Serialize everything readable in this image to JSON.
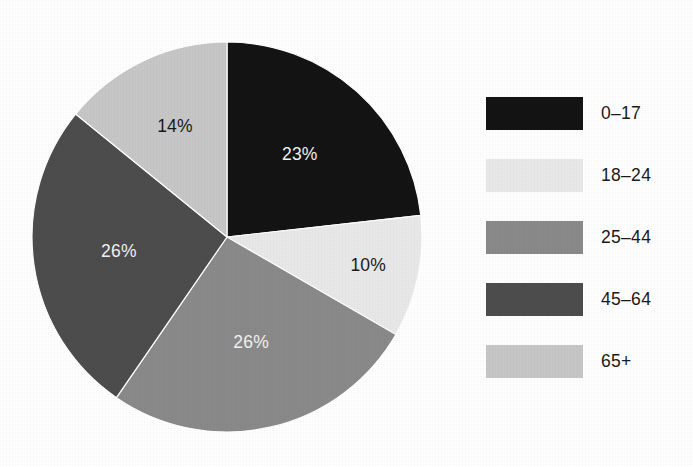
{
  "chart_data": {
    "type": "pie",
    "title": "",
    "subtitle": "",
    "xlabel": "",
    "ylabel": "",
    "grid": false,
    "legend_position": "right",
    "start_angle_deg": 0,
    "direction": "clockwise",
    "categories": [
      "0–17",
      "18–24",
      "25–44",
      "45–64",
      "65+"
    ],
    "values": [
      23,
      10,
      26,
      26,
      14
    ],
    "value_unit": "%",
    "data_labels": [
      "23%",
      "10%",
      "26%",
      "26%",
      "14%"
    ],
    "colors": [
      "#141414",
      "#e9e9e9",
      "#8a8a8a",
      "#4d4d4d",
      "#c7c7c7"
    ],
    "label_text_colors": [
      "#f2f2f2",
      "#1a1a1a",
      "#f2f2f2",
      "#f2f2f2",
      "#1a1a1a"
    ],
    "slices": [
      {
        "label": "0–17",
        "value": 23,
        "data_label": "23%",
        "color": "#141414",
        "label_color": "#f2f2f2"
      },
      {
        "label": "18–24",
        "value": 10,
        "data_label": "10%",
        "color": "#e9e9e9",
        "label_color": "#1a1a1a"
      },
      {
        "label": "25–44",
        "value": 26,
        "data_label": "26%",
        "color": "#8a8a8a",
        "label_color": "#f2f2f2"
      },
      {
        "label": "45–64",
        "value": 26,
        "data_label": "26%",
        "color": "#4d4d4d",
        "label_color": "#f2f2f2"
      },
      {
        "label": "65+",
        "value": 14,
        "data_label": "14%",
        "color": "#c7c7c7",
        "label_color": "#1a1a1a"
      }
    ]
  },
  "legend": {
    "items": [
      {
        "label": "0–17",
        "color": "#141414"
      },
      {
        "label": "18–24",
        "color": "#e9e9e9"
      },
      {
        "label": "25–44",
        "color": "#8a8a8a"
      },
      {
        "label": "45–64",
        "color": "#4d4d4d"
      },
      {
        "label": "65+",
        "color": "#c7c7c7"
      }
    ]
  },
  "figure": {
    "background": "#ffffff",
    "pie_center_x": 227,
    "pie_center_y": 237,
    "pie_radius": 195
  }
}
